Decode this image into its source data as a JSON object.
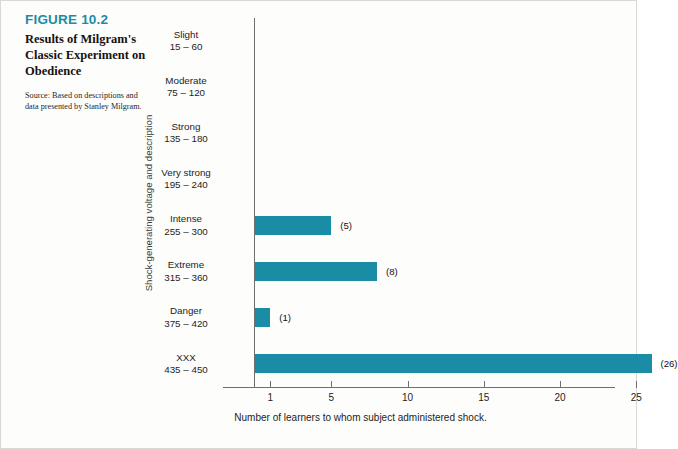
{
  "figure": {
    "number_label": "FIGURE 10.2",
    "title": "Results of Milgram's Classic Experiment on Obedience",
    "source": "Source: Based on descriptions and data presented by Stanley Milgram.",
    "accent_color": "#1B8CA6",
    "axis_color": "#6f6f6f",
    "background_color": "#fdfdfc"
  },
  "chart_data": {
    "type": "bar",
    "orientation": "horizontal",
    "title": "Results of Milgram's Classic Experiment on Obedience",
    "subtitle": "",
    "xlabel": "Number of learners to whom subject administered shock.",
    "ylabel": "Shock-generating voltage and description",
    "categories": [
      "Slight 15 – 60",
      "Moderate 75 – 120",
      "Strong 135 – 180",
      "Very strong 195 – 240",
      "Intense 255 – 300",
      "Extreme 315 – 360",
      "Danger 375 – 420",
      "XXX 435 – 450"
    ],
    "category_names": [
      "Slight",
      "Moderate",
      "Strong",
      "Very strong",
      "Intense",
      "Extreme",
      "Danger",
      "XXX"
    ],
    "category_ranges": [
      "15 – 60",
      "75 – 120",
      "135 – 180",
      "195 – 240",
      "255 – 300",
      "315 – 360",
      "375 – 420",
      "435 – 450"
    ],
    "values": [
      0,
      0,
      0,
      0,
      5,
      8,
      1,
      26
    ],
    "value_labels": [
      "",
      "",
      "",
      "",
      "(5)",
      "(8)",
      "(1)",
      "(26)"
    ],
    "xticks": [
      1,
      5,
      10,
      15,
      20,
      25
    ],
    "xtick_labels": [
      "1",
      "5",
      "10",
      "15",
      "20",
      "25"
    ],
    "xlim": [
      0,
      26.5
    ],
    "grid": false,
    "legend": null,
    "bar_color": "#1B8CA6"
  }
}
